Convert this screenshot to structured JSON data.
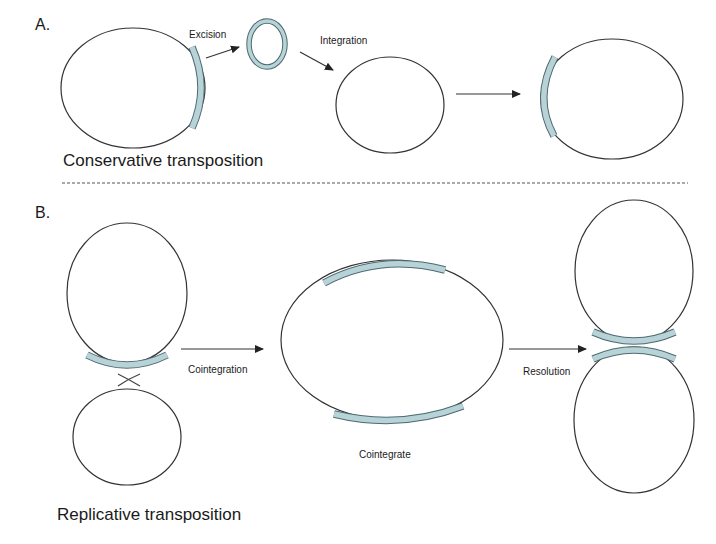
{
  "diagram": {
    "panel_a": {
      "label": "A.",
      "title": "Conservative transposition",
      "steps": {
        "excision": "Excision",
        "integration": "Integration"
      }
    },
    "panel_b": {
      "label": "B.",
      "title": "Replicative transposition",
      "steps": {
        "cointegration": "Cointegration",
        "cointegrate": "Cointegrate",
        "resolution": "Resolution"
      }
    },
    "colors": {
      "transposon_fill": "#b7d3d8",
      "transposon_stroke": "#4e6a70",
      "line": "#333333"
    }
  }
}
